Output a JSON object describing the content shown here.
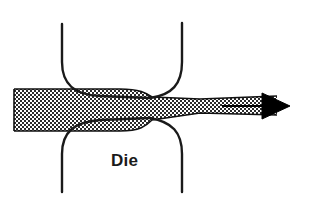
{
  "figure": {
    "background_color": "#ffffff",
    "width": 309,
    "height": 216
  },
  "labels": {
    "die": "Die"
  },
  "colors": {
    "outline": "#1a1a1a",
    "workpiece_stroke": "#111111",
    "workpiece_fill": "checkerboard-halftone",
    "arrow": "#000000",
    "background": "#ffffff"
  },
  "icons": {
    "arrow": "right-arrow-icon",
    "hatch": "checkerboard-hatch-icon"
  },
  "geometry": {
    "workpiece": {
      "entry_thickness_px": 42,
      "exit_thickness_px": 19,
      "entry_top_y": 89,
      "entry_bottom_y": 131,
      "exit_top_y": 96,
      "exit_bottom_y": 115,
      "left_x": 14,
      "right_x": 277
    },
    "die_upper": {
      "left_wall_x": 62,
      "right_wall_x": 182,
      "top_y": 24,
      "throat_y": 97
    },
    "die_lower": {
      "left_wall_x": 62,
      "right_wall_x": 182,
      "bottom_y": 192,
      "throat_y": 120
    },
    "throat_center_x": 150,
    "arrow": {
      "shaft_start_x": 222,
      "shaft_y": 106,
      "tip_x": 290,
      "head_base_x": 262,
      "head_half_height": 13
    }
  }
}
